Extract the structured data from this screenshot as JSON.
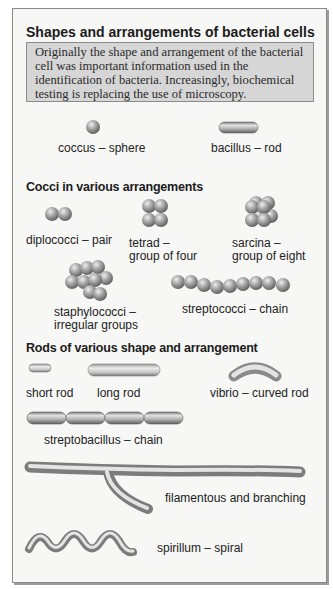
{
  "title": "Shapes and arrangements of bacterial cells",
  "intro": "Originally the shape and arrangement of the bacterial cell was important information used in the identification of bacteria. Increasingly, biochemical testing is replacing the use of microscopy.",
  "basic": {
    "coccus": "coccus – sphere",
    "bacillus": "bacillus – rod"
  },
  "cocci": {
    "heading": "Cocci in various arrangements",
    "diplococci": "diplococci – pair",
    "tetrad_1": "tetrad –",
    "tetrad_2": "group of four",
    "sarcina_1": "sarcina –",
    "sarcina_2": "group of eight",
    "staph_1": "staphylococci –",
    "staph_2": "irregular groups",
    "strepto": "streptococci – chain"
  },
  "rods": {
    "heading": "Rods of various shape and arrangement",
    "short_rod": "short rod",
    "long_rod": "long rod",
    "vibrio": "vibrio – curved rod",
    "streptobacillus": "streptobacillus – chain",
    "filamentous": "filamentous and branching",
    "spirillum": "spirillum – spiral"
  },
  "colors": {
    "panel_bg": "#f7f7f6",
    "intro_bg": "#d6d6d6",
    "cell_light": "#d8d8d8",
    "cell_dark": "#6e6e6e"
  }
}
